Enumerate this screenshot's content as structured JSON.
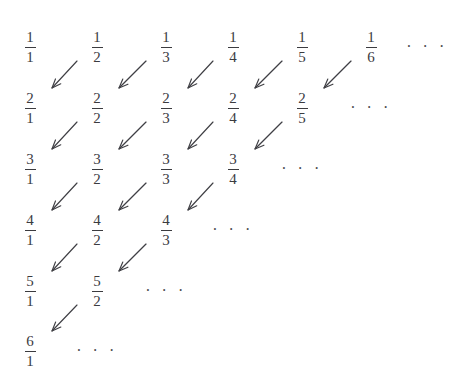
{
  "figure": {
    "background_color": "#ffffff",
    "text_color": "#3b3b3f",
    "arrow_color": "#3f3f44"
  },
  "layout": {
    "column_x": [
      30,
      97,
      166,
      233,
      302,
      371,
      427
    ],
    "row_y": [
      30,
      91,
      152,
      213,
      274,
      334
    ],
    "column_spacing": 67,
    "row_spacing": 61
  },
  "ellipsis_text": "· · ·",
  "grid": {
    "rows": [
      {
        "row_index": 1,
        "numerator": "1",
        "cells": [
          {
            "col": 1,
            "numerator": "1",
            "denominator": "1",
            "label": "1/1"
          },
          {
            "col": 2,
            "numerator": "1",
            "denominator": "2",
            "label": "1/2"
          },
          {
            "col": 3,
            "numerator": "1",
            "denominator": "3",
            "label": "1/3"
          },
          {
            "col": 4,
            "numerator": "1",
            "denominator": "4",
            "label": "1/4"
          },
          {
            "col": 5,
            "numerator": "1",
            "denominator": "5",
            "label": "1/5"
          },
          {
            "col": 6,
            "numerator": "1",
            "denominator": "6",
            "label": "1/6"
          }
        ],
        "ellipsis_col": 7
      },
      {
        "row_index": 2,
        "numerator": "2",
        "cells": [
          {
            "col": 1,
            "numerator": "2",
            "denominator": "1",
            "label": "2/1"
          },
          {
            "col": 2,
            "numerator": "2",
            "denominator": "2",
            "label": "2/2"
          },
          {
            "col": 3,
            "numerator": "2",
            "denominator": "3",
            "label": "2/3"
          },
          {
            "col": 4,
            "numerator": "2",
            "denominator": "4",
            "label": "2/4"
          },
          {
            "col": 5,
            "numerator": "2",
            "denominator": "5",
            "label": "2/5"
          }
        ],
        "ellipsis_col": 6
      },
      {
        "row_index": 3,
        "numerator": "3",
        "cells": [
          {
            "col": 1,
            "numerator": "3",
            "denominator": "1",
            "label": "3/1"
          },
          {
            "col": 2,
            "numerator": "3",
            "denominator": "2",
            "label": "3/2"
          },
          {
            "col": 3,
            "numerator": "3",
            "denominator": "3",
            "label": "3/3"
          },
          {
            "col": 4,
            "numerator": "3",
            "denominator": "4",
            "label": "3/4"
          }
        ],
        "ellipsis_col": 5
      },
      {
        "row_index": 4,
        "numerator": "4",
        "cells": [
          {
            "col": 1,
            "numerator": "4",
            "denominator": "1",
            "label": "4/1"
          },
          {
            "col": 2,
            "numerator": "4",
            "denominator": "2",
            "label": "4/2"
          },
          {
            "col": 3,
            "numerator": "4",
            "denominator": "3",
            "label": "4/3"
          }
        ],
        "ellipsis_col": 4
      },
      {
        "row_index": 5,
        "numerator": "5",
        "cells": [
          {
            "col": 1,
            "numerator": "5",
            "denominator": "1",
            "label": "5/1"
          },
          {
            "col": 2,
            "numerator": "5",
            "denominator": "2",
            "label": "5/2"
          }
        ],
        "ellipsis_col": 3
      },
      {
        "row_index": 6,
        "numerator": "6",
        "cells": [
          {
            "col": 1,
            "numerator": "6",
            "denominator": "1",
            "label": "6/1"
          }
        ],
        "ellipsis_col": 2
      }
    ]
  },
  "arrows": {
    "description": "Diagonal arrows pointing down-left from row r column c+1 toward row r+1 column c",
    "direction": "down-left",
    "items": [
      {
        "from_row": 1,
        "from_col": 2,
        "to_row": 2,
        "to_col": 1
      },
      {
        "from_row": 1,
        "from_col": 3,
        "to_row": 2,
        "to_col": 2
      },
      {
        "from_row": 1,
        "from_col": 4,
        "to_row": 2,
        "to_col": 3
      },
      {
        "from_row": 1,
        "from_col": 5,
        "to_row": 2,
        "to_col": 4
      },
      {
        "from_row": 1,
        "from_col": 6,
        "to_row": 2,
        "to_col": 5
      },
      {
        "from_row": 2,
        "from_col": 2,
        "to_row": 3,
        "to_col": 1
      },
      {
        "from_row": 2,
        "from_col": 3,
        "to_row": 3,
        "to_col": 2
      },
      {
        "from_row": 2,
        "from_col": 4,
        "to_row": 3,
        "to_col": 3
      },
      {
        "from_row": 2,
        "from_col": 5,
        "to_row": 3,
        "to_col": 4
      },
      {
        "from_row": 3,
        "from_col": 2,
        "to_row": 4,
        "to_col": 1
      },
      {
        "from_row": 3,
        "from_col": 3,
        "to_row": 4,
        "to_col": 2
      },
      {
        "from_row": 3,
        "from_col": 4,
        "to_row": 4,
        "to_col": 3
      },
      {
        "from_row": 4,
        "from_col": 2,
        "to_row": 5,
        "to_col": 1
      },
      {
        "from_row": 4,
        "from_col": 3,
        "to_row": 5,
        "to_col": 2
      },
      {
        "from_row": 5,
        "from_col": 2,
        "to_row": 6,
        "to_col": 1
      }
    ]
  }
}
